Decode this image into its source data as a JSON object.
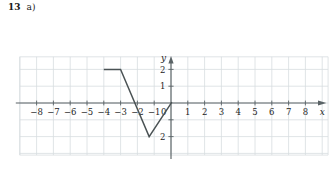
{
  "exercise": {
    "number": "13",
    "part": "a)"
  },
  "graph": {
    "axis_labels": {
      "x": "x",
      "y": "y"
    },
    "origin_label": "0",
    "x_ticks": [
      {
        "value": -8,
        "label": "−8"
      },
      {
        "value": -7,
        "label": "−7"
      },
      {
        "value": -6,
        "label": "−6"
      },
      {
        "value": -5,
        "label": "−5"
      },
      {
        "value": -4,
        "label": "−4"
      },
      {
        "value": -3,
        "label": "−3"
      },
      {
        "value": -2,
        "label": "−2"
      },
      {
        "value": -1,
        "label": "−1"
      },
      {
        "value": 1,
        "label": "1"
      },
      {
        "value": 2,
        "label": "2"
      },
      {
        "value": 3,
        "label": "3"
      },
      {
        "value": 4,
        "label": "4"
      },
      {
        "value": 5,
        "label": "5"
      },
      {
        "value": 6,
        "label": "6"
      },
      {
        "value": 7,
        "label": "7"
      },
      {
        "value": 8,
        "label": "8"
      }
    ],
    "y_ticks": [
      {
        "value": 2,
        "label": "2"
      },
      {
        "value": 1,
        "label": "1"
      },
      {
        "value": -1,
        "label": ""
      },
      {
        "value": -2,
        "label": "2"
      }
    ],
    "colors": {
      "grid": "#d8dde0",
      "axis": "#5a6366",
      "curve": "#4a5254",
      "text": "#1c1c1c",
      "background": "#ffffff"
    }
  },
  "chart_data": {
    "type": "line",
    "title": "",
    "xlabel": "x",
    "ylabel": "y",
    "xlim": [
      -9,
      9
    ],
    "ylim": [
      -3.1,
      2.8
    ],
    "grid": true,
    "legend": "none",
    "series": [
      {
        "name": "piecewise-linear graph",
        "points": [
          [
            -4.0,
            2.0
          ],
          [
            -3.0,
            2.0
          ],
          [
            -1.3,
            -2.0
          ],
          [
            0.05,
            0.05
          ]
        ]
      }
    ],
    "annotations": []
  }
}
